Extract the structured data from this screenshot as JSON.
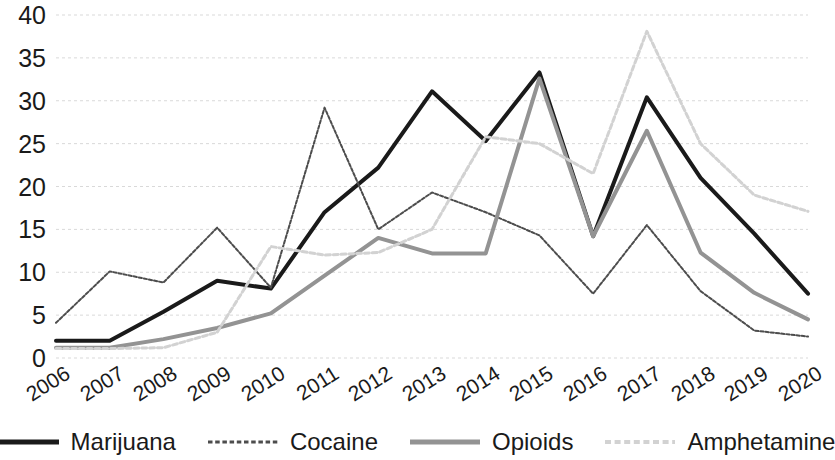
{
  "chart_data": {
    "type": "line",
    "title": "",
    "subtitle": "",
    "xlabel": "",
    "ylabel": "",
    "categories": [
      "2006",
      "2007",
      "2008",
      "2009",
      "2010",
      "2011",
      "2012",
      "2013",
      "2014",
      "2015",
      "2016",
      "2017",
      "2018",
      "2019",
      "2020"
    ],
    "x": [
      2006,
      2007,
      2008,
      2009,
      2010,
      2011,
      2012,
      2013,
      2014,
      2015,
      2016,
      2017,
      2018,
      2019,
      2020
    ],
    "ylim": [
      0,
      40
    ],
    "xlim": [
      2006,
      2020
    ],
    "y_ticks": [
      0,
      5,
      10,
      15,
      20,
      25,
      30,
      35,
      40
    ],
    "y_tick_labels": [
      "0",
      "5",
      "10",
      "15",
      "20",
      "25",
      "30",
      "35",
      "40"
    ],
    "grid": true,
    "grid_axis": "y",
    "grid_color": "#d9d9d9",
    "legend_position": "bottom",
    "series": [
      {
        "name": "Marijuana",
        "color": "#1a1a1a",
        "style": "solid",
        "width": 4,
        "values": [
          2.0,
          2.0,
          5.4,
          9.0,
          8.1,
          17.0,
          22.2,
          31.1,
          25.3,
          33.3,
          14.2,
          30.4,
          21.0,
          14.5,
          7.5
        ]
      },
      {
        "name": "Cocaine",
        "color": "#4d4d4d",
        "style": "dashed",
        "width": 2,
        "values": [
          4.1,
          10.1,
          8.8,
          15.2,
          8.2,
          29.2,
          15.0,
          19.3,
          17.0,
          14.3,
          7.5,
          15.5,
          7.8,
          3.2,
          2.5
        ]
      },
      {
        "name": "Opioids",
        "color": "#939393",
        "style": "solid",
        "width": 4,
        "values": [
          1.2,
          1.2,
          2.2,
          3.5,
          5.2,
          9.6,
          14.0,
          12.2,
          12.2,
          32.6,
          14.2,
          26.5,
          12.3,
          7.6,
          4.5
        ]
      },
      {
        "name": "Amphetamine",
        "color": "#d2d2d2",
        "style": "dashed",
        "width": 3,
        "values": [
          1.1,
          1.1,
          1.2,
          3.0,
          13.0,
          12.0,
          12.3,
          15.0,
          25.8,
          25.0,
          21.5,
          38.1,
          25.0,
          19.0,
          17.1
        ]
      }
    ]
  },
  "legend": {
    "items": [
      {
        "label": "Marijuana"
      },
      {
        "label": "Cocaine"
      },
      {
        "label": "Opioids"
      },
      {
        "label": "Amphetamine"
      }
    ]
  }
}
